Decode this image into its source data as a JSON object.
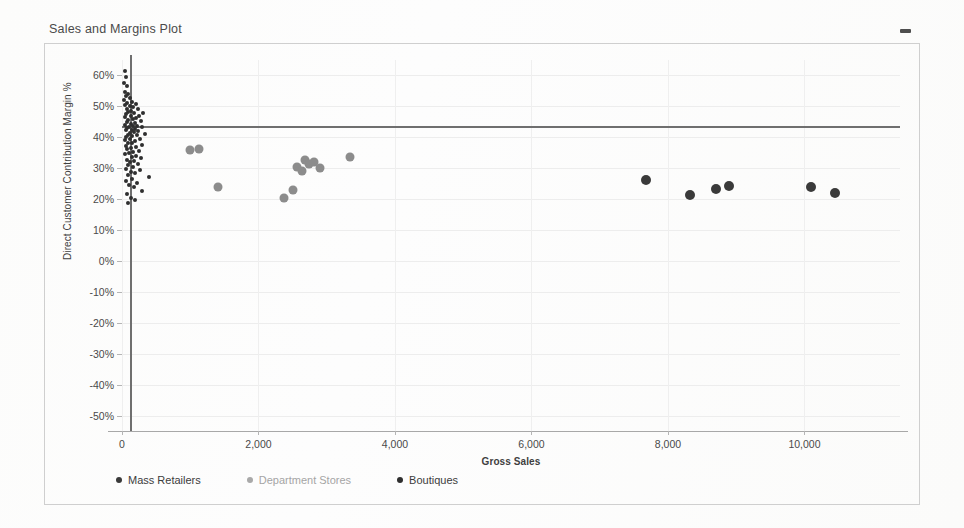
{
  "window": {
    "title": "Sales and Margins Plot",
    "minimize_label": "–"
  },
  "legend": {
    "position": "bottom",
    "items": [
      {
        "label": "Mass Retailers",
        "color": "#3a3a3a",
        "key": "mass"
      },
      {
        "label": "Department Stores",
        "color": "#a9a9a9",
        "key": "department"
      },
      {
        "label": "Boutiques",
        "color": "#2f2f2f",
        "key": "boutiques"
      }
    ]
  },
  "chart_data": {
    "type": "scatter",
    "title": "Sales and Margins Plot",
    "xlabel": "Gross Sales",
    "ylabel": "Direct Customer Contribution Margin %",
    "xlim": [
      0,
      11400
    ],
    "ylim": [
      -0.55,
      0.65
    ],
    "grid": true,
    "x_ticks": [
      0,
      2000,
      4000,
      6000,
      8000,
      10000
    ],
    "x_tick_labels": [
      "0",
      "2,000",
      "4,000",
      "6,000",
      "8,000",
      "10,000"
    ],
    "y_ticks": [
      0.6,
      0.5,
      0.4,
      0.3,
      0.2,
      0.1,
      0.0,
      -0.1,
      -0.2,
      -0.3,
      -0.4,
      -0.5
    ],
    "y_tick_labels": [
      "60%",
      "50%",
      "40%",
      "30%",
      "20%",
      "10%",
      "0%",
      "-10%",
      "-20%",
      "-30%",
      "-40%",
      "-50%"
    ],
    "reference_lines": [
      {
        "orientation": "horizontal",
        "value": 0.435,
        "label": "average margin",
        "color": "#6f6f6f",
        "x_end": 11400
      },
      {
        "orientation": "vertical",
        "value": 120,
        "label": "average sales",
        "color": "#6f6f6f"
      }
    ],
    "series": [
      {
        "name": "Boutiques",
        "color": "#2f2f2f",
        "marker": "circle",
        "size": 4,
        "points": [
          {
            "x": 40,
            "y": 0.615
          },
          {
            "x": 55,
            "y": 0.595
          },
          {
            "x": 30,
            "y": 0.575
          },
          {
            "x": 70,
            "y": 0.565
          },
          {
            "x": 45,
            "y": 0.548
          },
          {
            "x": 95,
            "y": 0.54
          },
          {
            "x": 60,
            "y": 0.532
          },
          {
            "x": 120,
            "y": 0.528
          },
          {
            "x": 35,
            "y": 0.52
          },
          {
            "x": 150,
            "y": 0.515
          },
          {
            "x": 80,
            "y": 0.512
          },
          {
            "x": 200,
            "y": 0.508
          },
          {
            "x": 50,
            "y": 0.503
          },
          {
            "x": 110,
            "y": 0.5
          },
          {
            "x": 165,
            "y": 0.497
          },
          {
            "x": 75,
            "y": 0.492
          },
          {
            "x": 230,
            "y": 0.49
          },
          {
            "x": 135,
            "y": 0.486
          },
          {
            "x": 90,
            "y": 0.483
          },
          {
            "x": 310,
            "y": 0.48
          },
          {
            "x": 180,
            "y": 0.478
          },
          {
            "x": 60,
            "y": 0.474
          },
          {
            "x": 250,
            "y": 0.47
          },
          {
            "x": 125,
            "y": 0.468
          },
          {
            "x": 40,
            "y": 0.465
          },
          {
            "x": 205,
            "y": 0.462
          },
          {
            "x": 155,
            "y": 0.459
          },
          {
            "x": 95,
            "y": 0.456
          },
          {
            "x": 275,
            "y": 0.452
          },
          {
            "x": 70,
            "y": 0.45
          },
          {
            "x": 185,
            "y": 0.447
          },
          {
            "x": 130,
            "y": 0.444
          },
          {
            "x": 50,
            "y": 0.441
          },
          {
            "x": 225,
            "y": 0.438
          },
          {
            "x": 160,
            "y": 0.436
          },
          {
            "x": 100,
            "y": 0.434
          },
          {
            "x": 290,
            "y": 0.432
          },
          {
            "x": 75,
            "y": 0.43
          },
          {
            "x": 195,
            "y": 0.428
          },
          {
            "x": 140,
            "y": 0.425
          },
          {
            "x": 55,
            "y": 0.422
          },
          {
            "x": 240,
            "y": 0.42
          },
          {
            "x": 170,
            "y": 0.417
          },
          {
            "x": 110,
            "y": 0.415
          },
          {
            "x": 330,
            "y": 0.412
          },
          {
            "x": 85,
            "y": 0.409
          },
          {
            "x": 215,
            "y": 0.406
          },
          {
            "x": 145,
            "y": 0.403
          },
          {
            "x": 65,
            "y": 0.4
          },
          {
            "x": 260,
            "y": 0.396
          },
          {
            "x": 120,
            "y": 0.393
          },
          {
            "x": 45,
            "y": 0.39
          },
          {
            "x": 190,
            "y": 0.387
          },
          {
            "x": 150,
            "y": 0.383
          },
          {
            "x": 90,
            "y": 0.38
          },
          {
            "x": 300,
            "y": 0.376
          },
          {
            "x": 60,
            "y": 0.372
          },
          {
            "x": 210,
            "y": 0.368
          },
          {
            "x": 135,
            "y": 0.365
          },
          {
            "x": 80,
            "y": 0.361
          },
          {
            "x": 245,
            "y": 0.357
          },
          {
            "x": 165,
            "y": 0.353
          },
          {
            "x": 105,
            "y": 0.349
          },
          {
            "x": 50,
            "y": 0.345
          },
          {
            "x": 200,
            "y": 0.341
          },
          {
            "x": 140,
            "y": 0.337
          },
          {
            "x": 285,
            "y": 0.333
          },
          {
            "x": 70,
            "y": 0.328
          },
          {
            "x": 175,
            "y": 0.324
          },
          {
            "x": 115,
            "y": 0.32
          },
          {
            "x": 230,
            "y": 0.315
          },
          {
            "x": 95,
            "y": 0.31
          },
          {
            "x": 155,
            "y": 0.305
          },
          {
            "x": 55,
            "y": 0.299
          },
          {
            "x": 265,
            "y": 0.294
          },
          {
            "x": 125,
            "y": 0.288
          },
          {
            "x": 185,
            "y": 0.283
          },
          {
            "x": 85,
            "y": 0.277
          },
          {
            "x": 400,
            "y": 0.272
          },
          {
            "x": 145,
            "y": 0.266
          },
          {
            "x": 65,
            "y": 0.259
          },
          {
            "x": 215,
            "y": 0.252
          },
          {
            "x": 105,
            "y": 0.245
          },
          {
            "x": 170,
            "y": 0.238
          },
          {
            "x": 300,
            "y": 0.226
          },
          {
            "x": 75,
            "y": 0.218
          },
          {
            "x": 135,
            "y": 0.205
          },
          {
            "x": 190,
            "y": 0.196
          },
          {
            "x": 95,
            "y": 0.186
          }
        ]
      },
      {
        "name": "Department Stores",
        "color": "#8c8c8c",
        "marker": "circle",
        "size": 9,
        "points": [
          {
            "x": 1000,
            "y": 0.36
          },
          {
            "x": 1130,
            "y": 0.362
          },
          {
            "x": 1410,
            "y": 0.24
          },
          {
            "x": 2370,
            "y": 0.205
          },
          {
            "x": 2510,
            "y": 0.228
          },
          {
            "x": 2560,
            "y": 0.305
          },
          {
            "x": 2680,
            "y": 0.327
          },
          {
            "x": 2640,
            "y": 0.292
          },
          {
            "x": 2740,
            "y": 0.312
          },
          {
            "x": 2820,
            "y": 0.32
          },
          {
            "x": 2900,
            "y": 0.3
          },
          {
            "x": 3340,
            "y": 0.335
          }
        ]
      },
      {
        "name": "Mass Retailers",
        "color": "#3a3a3a",
        "marker": "circle",
        "size": 10,
        "points": [
          {
            "x": 7680,
            "y": 0.262
          },
          {
            "x": 8320,
            "y": 0.213
          },
          {
            "x": 8700,
            "y": 0.232
          },
          {
            "x": 8900,
            "y": 0.242
          },
          {
            "x": 10100,
            "y": 0.24
          },
          {
            "x": 10450,
            "y": 0.22
          }
        ]
      }
    ]
  }
}
